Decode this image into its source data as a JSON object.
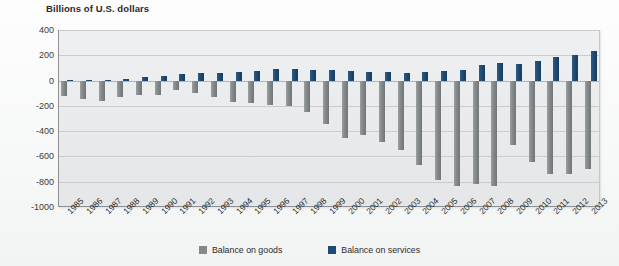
{
  "chart_data": {
    "type": "bar",
    "title": "Billions of U.S. dollars",
    "xlabel": "",
    "ylabel": "Billions of U.S. dollars",
    "ylim": [
      -1000,
      400
    ],
    "yticks": [
      400,
      200,
      0,
      -200,
      -400,
      -600,
      -800,
      -1000
    ],
    "ytick_labels": [
      "400",
      "200",
      "0",
      "-200",
      "-400",
      "-600",
      "-800",
      "-1000"
    ],
    "grid": true,
    "legend_position": "bottom-center",
    "categories": [
      "1985",
      "1986",
      "1987",
      "1988",
      "1989",
      "1990",
      "1991",
      "1992",
      "1993",
      "1994",
      "1995",
      "1996",
      "1997",
      "1998",
      "1999",
      "2000",
      "2001",
      "2002",
      "2003",
      "2004",
      "2005",
      "2006",
      "2007",
      "2008",
      "2009",
      "2010",
      "2011",
      "2012",
      "2013"
    ],
    "series": [
      {
        "name": "Balance on goods",
        "color": "#83888a",
        "values": [
          -122,
          -145,
          -160,
          -127,
          -116,
          -111,
          -77,
          -97,
          -133,
          -166,
          -174,
          -191,
          -198,
          -247,
          -346,
          -452,
          -427,
          -482,
          -547,
          -665,
          -783,
          -837,
          -821,
          -832,
          -510,
          -648,
          -741,
          -742,
          -702
        ]
      },
      {
        "name": "Balance on services",
        "color": "#1f4a74",
        "values": [
          1,
          7,
          8,
          13,
          31,
          39,
          51,
          60,
          63,
          68,
          78,
          89,
          91,
          83,
          84,
          77,
          67,
          67,
          62,
          67,
          77,
          84,
          125,
          136,
          133,
          154,
          188,
          205,
          233
        ]
      }
    ]
  },
  "legend": {
    "items": [
      {
        "label": "Balance on goods",
        "swatch": "legend-swatch-goods"
      },
      {
        "label": "Balance on services",
        "swatch": "legend-swatch-services"
      }
    ]
  }
}
